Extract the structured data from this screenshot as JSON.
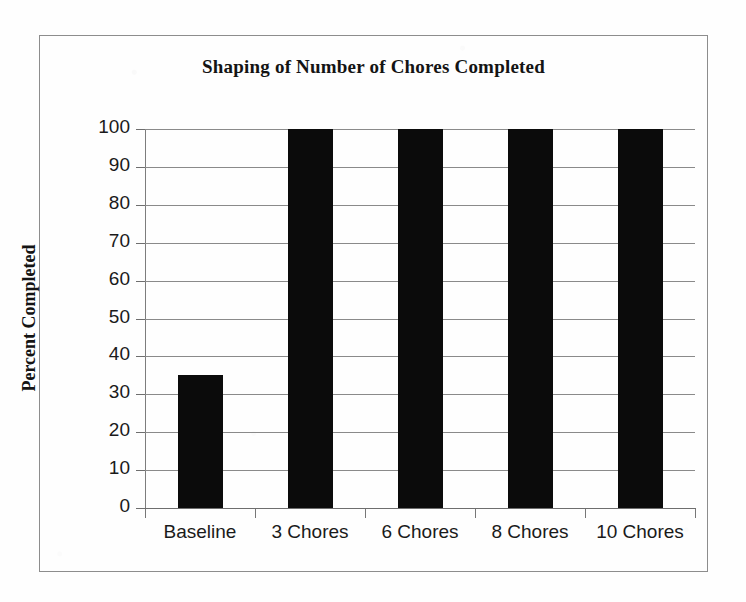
{
  "chart_data": {
    "type": "bar",
    "title": "Shaping of Number of Chores Completed",
    "xlabel": "",
    "ylabel": "Percent Completed",
    "categories": [
      "Baseline",
      "3 Chores",
      "6 Chores",
      "8 Chores",
      "10 Chores"
    ],
    "values": [
      35,
      100,
      100,
      100,
      100
    ],
    "ylim": [
      0,
      100
    ],
    "ytick_labels": [
      "100",
      "90",
      "80",
      "70",
      "60",
      "50",
      "40",
      "30",
      "20",
      "10",
      "0"
    ],
    "ytick_values": [
      100,
      90,
      80,
      70,
      60,
      50,
      40,
      30,
      20,
      10,
      0
    ],
    "grid": true,
    "grid_axis": "y",
    "legend": false,
    "legend_position": "none",
    "series": [
      {
        "name": "Percent Completed",
        "values": [
          35,
          100,
          100,
          100,
          100
        ],
        "color": "#0b0b0b"
      }
    ],
    "colors": {
      "bar": "#0b0b0b",
      "gridline": "#8a8a8a",
      "axis": "#6e6e6e",
      "frame": "#8d8d8d",
      "text": "#1a1a1a",
      "background": "#fefefe"
    }
  }
}
